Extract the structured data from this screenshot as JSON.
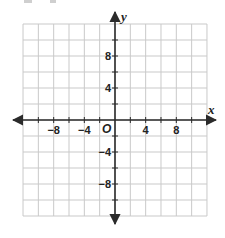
{
  "chart_data": {
    "type": "coordinate-grid",
    "title": "",
    "xlabel": "x",
    "ylabel": "y",
    "origin_label": "O",
    "xlim": [
      -12,
      12
    ],
    "ylim": [
      -12,
      12
    ],
    "grid": true,
    "grid_step": 2,
    "x_ticks": [
      -10,
      -8,
      -6,
      -4,
      -2,
      2,
      4,
      6,
      8,
      10
    ],
    "y_ticks": [
      -10,
      -8,
      -6,
      -4,
      -2,
      2,
      4,
      6,
      8,
      10
    ],
    "x_tick_labels": [
      {
        "value": -8,
        "label": "−8"
      },
      {
        "value": -4,
        "label": "−4"
      },
      {
        "value": 4,
        "label": "4"
      },
      {
        "value": 8,
        "label": "8"
      }
    ],
    "y_tick_labels": [
      {
        "value": 8,
        "label": "8"
      },
      {
        "value": 4,
        "label": "4"
      },
      {
        "value": -4,
        "label": "−4"
      },
      {
        "value": -8,
        "label": "−8"
      }
    ],
    "series": []
  },
  "colors": {
    "grid": "#c9c9c9",
    "axis": "#2b2b2b",
    "text": "#222222",
    "background": "#ffffff"
  }
}
